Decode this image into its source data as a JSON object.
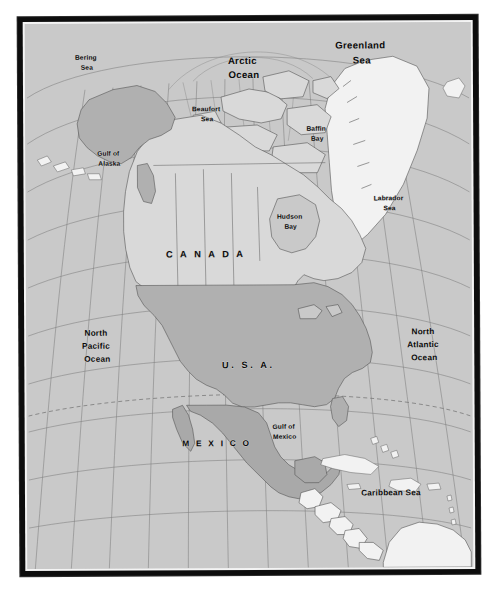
{
  "figure": {
    "kind": "reference-map",
    "region": "North America",
    "projection_hint": "conic with curved graticule"
  },
  "palette": {
    "frame": "#0d0d0d",
    "page": "#ffffff",
    "ocean": "#c9c9c9",
    "canada_fill": "#d9d9d9",
    "usa_fill": "#b0b0b0",
    "mexico_fill": "#a9a9a9",
    "other_land_fill": "#f2f2f2",
    "graticule": "#7d7d7d",
    "coastline": "#4a4a4a",
    "label_text": "#0a0a0a"
  },
  "labels": {
    "countries": [
      {
        "id": "canada",
        "text": "C A N A D A",
        "plain": "CANADA",
        "x": 199,
        "y": 234,
        "size": "lg"
      },
      {
        "id": "usa",
        "text": "U. S. A.",
        "plain": "U.S.A.",
        "x": 240,
        "y": 345,
        "size": "lg"
      },
      {
        "id": "mexico",
        "text": "M E X I C O",
        "plain": "MEXICO",
        "x": 209,
        "y": 423,
        "size": "md"
      }
    ],
    "oceans": [
      {
        "id": "arctic-ocean",
        "lines": [
          "Arctic",
          "Ocean"
        ],
        "x": 219,
        "y": 41,
        "size": "lg"
      },
      {
        "id": "north-pacific-ocean",
        "lines": [
          "North",
          "Pacific",
          "Ocean"
        ],
        "x": 71,
        "y": 312,
        "size": "md"
      },
      {
        "id": "north-atlantic-ocean",
        "lines": [
          "North",
          "Atlantic",
          "Ocean"
        ],
        "x": 428,
        "y": 312,
        "size": "md"
      }
    ],
    "seas": [
      {
        "id": "bering-sea",
        "lines": [
          "Bering",
          "Sea"
        ],
        "x": 82,
        "y": 50,
        "size": "sm"
      },
      {
        "id": "greenland-sea",
        "lines": [
          "Greenland",
          "Sea"
        ],
        "x": 361,
        "y": 38,
        "size": "lg"
      },
      {
        "id": "beaufort-sea",
        "lines": [
          "Beaufort",
          "Sea"
        ],
        "x": 201,
        "y": 101,
        "size": "sm"
      },
      {
        "id": "baffin-bay",
        "lines": [
          "Baffin",
          "Bay"
        ],
        "x": 310,
        "y": 121,
        "size": "sm"
      },
      {
        "id": "gulf-of-alaska",
        "lines": [
          "Gulf of",
          "Alaska"
        ],
        "x": 103,
        "y": 147,
        "size": "sm"
      },
      {
        "id": "labrador-sea",
        "lines": [
          "Labrador",
          "Sea"
        ],
        "x": 385,
        "y": 192,
        "size": "sm"
      },
      {
        "id": "hudson-bay",
        "lines": [
          "Hudson",
          "Bay"
        ],
        "x": 282,
        "y": 209,
        "size": "sm"
      },
      {
        "id": "gulf-of-mexico",
        "lines": [
          "Gulf of",
          "Mexico"
        ],
        "x": 277,
        "y": 418,
        "size": "sm"
      },
      {
        "id": "caribbean-sea",
        "lines": [
          "Caribbean Sea"
        ],
        "x": 381,
        "y": 485,
        "size": "md"
      }
    ]
  },
  "grid": {
    "tropic_of_cancer_visible": true,
    "graticule_visible": true
  }
}
